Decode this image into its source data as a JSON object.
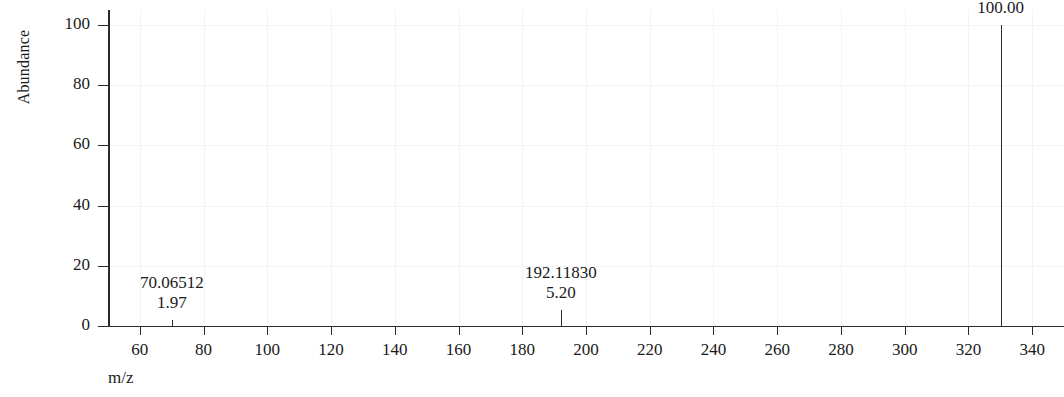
{
  "chart_data": {
    "type": "bar",
    "title": "",
    "subtitle": "",
    "xlabel": "m/z",
    "ylabel": "Abundance",
    "xlim": [
      50,
      350
    ],
    "ylim": [
      0,
      105
    ],
    "grid": true,
    "legend": null,
    "x_ticks": [
      60,
      80,
      100,
      120,
      140,
      160,
      180,
      200,
      220,
      240,
      260,
      280,
      300,
      320,
      340
    ],
    "x_tick_labels": [
      "60",
      "80",
      "100",
      "120",
      "140",
      "160",
      "180",
      "200",
      "220",
      "240",
      "260",
      "280",
      "300",
      "320",
      "340"
    ],
    "y_ticks": [
      0,
      20,
      40,
      60,
      80,
      100
    ],
    "y_tick_labels": [
      "0",
      "20",
      "40",
      "60",
      "80",
      "100"
    ],
    "x": [
      70.06512,
      192.1183,
      330.14999
    ],
    "values": [
      1.97,
      5.2,
      100.0
    ],
    "peaks": [
      {
        "mz": "70.06512",
        "abundance": "1.97",
        "mz_value": 70.06512,
        "abundance_value": 1.97
      },
      {
        "mz": "192.11830",
        "abundance": "5.20",
        "mz_value": 192.1183,
        "abundance_value": 5.2
      },
      {
        "mz": "330.14999",
        "abundance": "100.00",
        "mz_value": 330.14999,
        "abundance_value": 100.0
      }
    ],
    "annotations": [
      {
        "text": "70.06512\n1.97",
        "x": 70.06512,
        "y": 1.97
      },
      {
        "text": "192.11830\n5.20",
        "x": 192.1183,
        "y": 5.2
      },
      {
        "text": "330.14999\n100.00",
        "x": 330.14999,
        "y": 100.0
      }
    ],
    "colors": {
      "axis": "#2b2b2b",
      "grid": "#f2f3f4",
      "peak": "#2b2b2b",
      "text": "#1a1a1a",
      "background": "#ffffff"
    }
  }
}
